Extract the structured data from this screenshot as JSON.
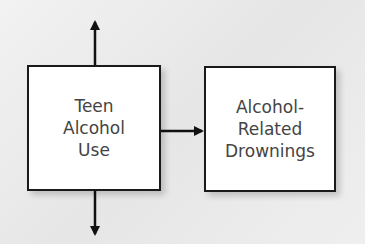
{
  "diagram": {
    "nodes": [
      {
        "id": "teen-alcohol-use",
        "lines": [
          "Teen",
          "Alcohol",
          "Use"
        ]
      },
      {
        "id": "alcohol-related-drownings",
        "lines": [
          "Alcohol-",
          "Related",
          "Drownings"
        ]
      }
    ],
    "edges": [
      {
        "from": "teen-alcohol-use",
        "to": "alcohol-related-drownings"
      },
      {
        "from": "teen-alcohol-use",
        "to": "up"
      },
      {
        "from": "teen-alcohol-use",
        "to": "down"
      }
    ],
    "colors": {
      "box_border": "#1a1a1a",
      "box_fill": "#ffffff",
      "text": "#444444",
      "background": "#ececec",
      "arrow": "#111111"
    }
  }
}
